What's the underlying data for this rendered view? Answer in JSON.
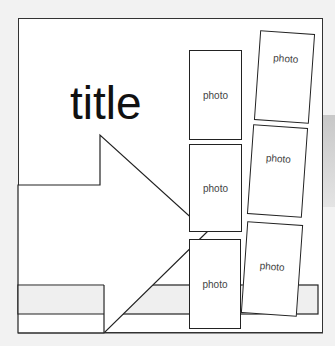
{
  "layout": {
    "title": "title",
    "photo_label": "photo",
    "photos": [
      {
        "id": "col1-top",
        "label": "photo"
      },
      {
        "id": "col1-middle",
        "label": "photo"
      },
      {
        "id": "col1-bottom",
        "label": "photo"
      },
      {
        "id": "col2-top",
        "label": "photo"
      },
      {
        "id": "col2-middle",
        "label": "photo"
      },
      {
        "id": "col2-bottom",
        "label": "photo"
      }
    ],
    "colors": {
      "background": "#f2f2f2",
      "page": "#ffffff",
      "stroke": "#222222",
      "strip": "#efefef"
    }
  }
}
